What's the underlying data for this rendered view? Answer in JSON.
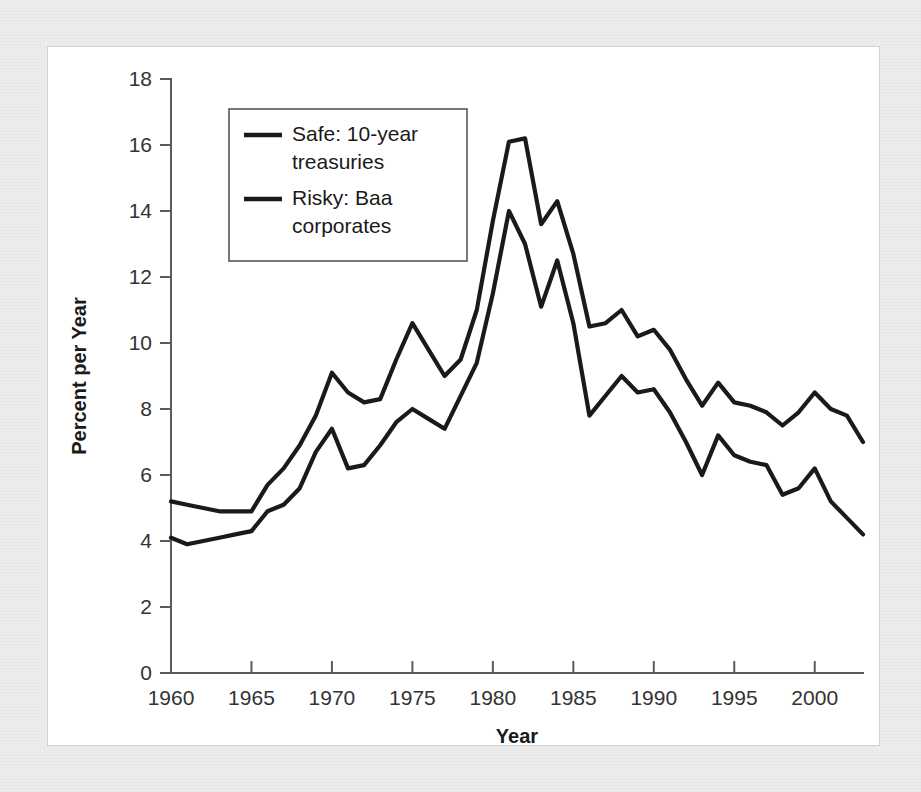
{
  "chart_data": {
    "type": "line",
    "title": "",
    "xlabel": "Year",
    "ylabel": "Percent per Year",
    "xlim": [
      1960,
      2003
    ],
    "ylim": [
      0,
      18
    ],
    "xticks": [
      1960,
      1965,
      1970,
      1975,
      1980,
      1985,
      1990,
      1995,
      2000
    ],
    "yticks": [
      0,
      2,
      4,
      6,
      8,
      10,
      12,
      14,
      16,
      18
    ],
    "xtick_labels": [
      "1960",
      "1965",
      "1970",
      "1975",
      "1980",
      "1985",
      "1990",
      "1995",
      "2000"
    ],
    "ytick_labels": [
      "0",
      "2",
      "4",
      "6",
      "8",
      "10",
      "12",
      "14",
      "16",
      "18"
    ],
    "grid": false,
    "legend_position": "upper-left",
    "x": [
      1960,
      1961,
      1962,
      1963,
      1964,
      1965,
      1966,
      1967,
      1968,
      1969,
      1970,
      1971,
      1972,
      1973,
      1974,
      1975,
      1976,
      1977,
      1978,
      1979,
      1980,
      1981,
      1982,
      1983,
      1984,
      1985,
      1986,
      1987,
      1988,
      1989,
      1990,
      1991,
      1992,
      1993,
      1994,
      1995,
      1996,
      1997,
      1998,
      1999,
      2000,
      2001,
      2002,
      2003
    ],
    "series": [
      {
        "name": "Risky: Baa corporates",
        "color": "#1a1a1a",
        "values": [
          5.2,
          5.1,
          5.0,
          4.9,
          4.9,
          4.9,
          5.7,
          6.2,
          6.9,
          7.8,
          9.1,
          8.5,
          8.2,
          8.3,
          9.5,
          10.6,
          9.8,
          9.0,
          9.5,
          11.0,
          13.7,
          16.1,
          16.2,
          13.6,
          14.3,
          12.7,
          10.5,
          10.6,
          11.0,
          10.2,
          10.4,
          9.8,
          8.9,
          8.1,
          8.8,
          8.2,
          8.1,
          7.9,
          7.5,
          7.9,
          8.5,
          8.0,
          7.8,
          7.0
        ]
      },
      {
        "name": "Safe: 10-year treasuries",
        "color": "#1a1a1a",
        "values": [
          4.1,
          3.9,
          4.0,
          4.1,
          4.2,
          4.3,
          4.9,
          5.1,
          5.6,
          6.7,
          7.4,
          6.2,
          6.3,
          6.9,
          7.6,
          8.0,
          7.7,
          7.4,
          8.4,
          9.4,
          11.5,
          14.0,
          13.0,
          11.1,
          12.5,
          10.6,
          7.8,
          8.4,
          9.0,
          8.5,
          8.6,
          7.9,
          7.0,
          6.0,
          7.2,
          6.6,
          6.4,
          6.3,
          5.4,
          5.6,
          6.2,
          5.2,
          4.7,
          4.2
        ]
      }
    ],
    "legend": [
      {
        "label_line1": "Safe: 10-year",
        "label_line2": "treasuries"
      },
      {
        "label_line1": "Risky: Baa",
        "label_line2": "corporates"
      }
    ]
  },
  "figure": {
    "panel_background": "#ffffff",
    "page_background": "#ededed",
    "axis_color": "#5b5b5b",
    "line_color": "#1a1a1a"
  }
}
